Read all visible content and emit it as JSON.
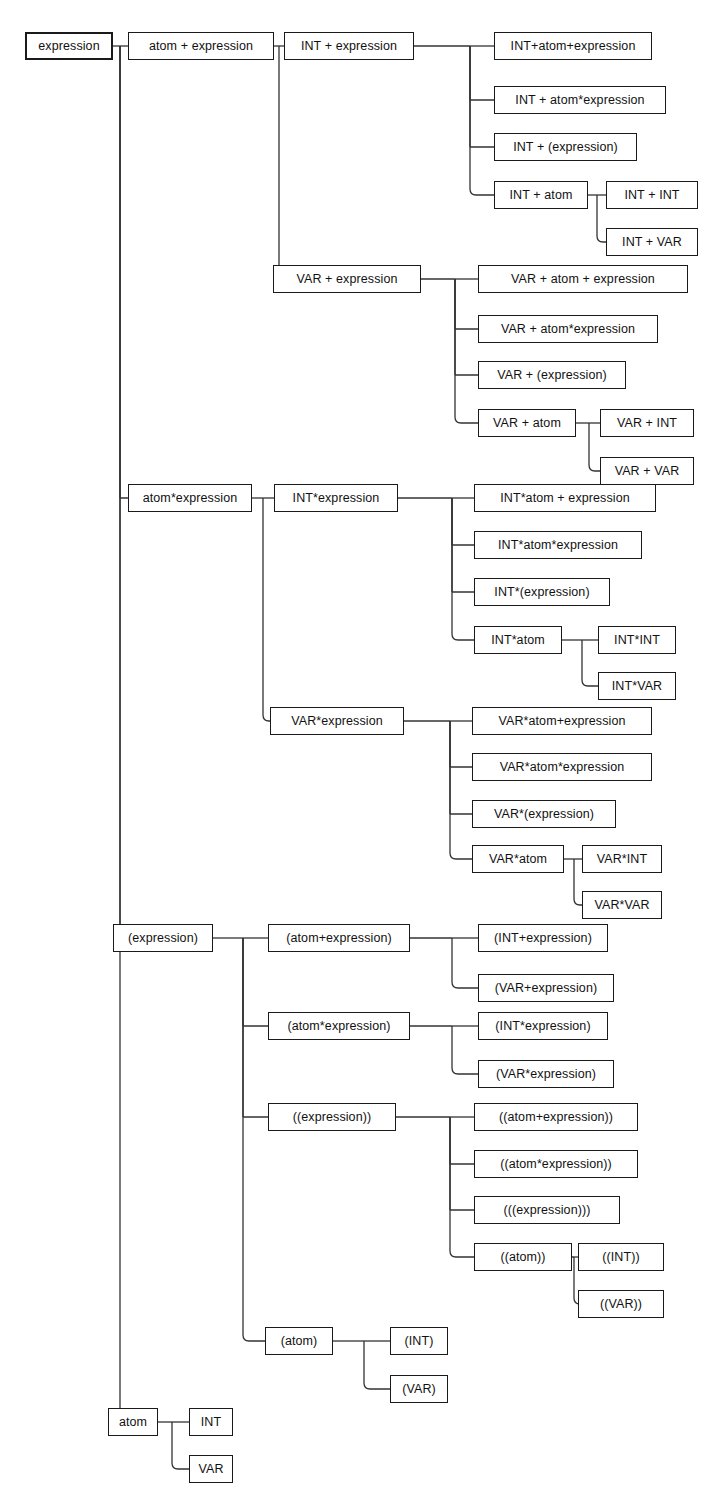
{
  "diagram": {
    "type": "tree-diagram",
    "width": 716,
    "height": 1503,
    "background_color": "#ffffff",
    "box_border_color": "#1a1a1a",
    "edge_color": "#333333",
    "text_color": "#111111"
  },
  "nodes": [
    {
      "id": "n0",
      "label": "expression",
      "x": 25,
      "y": 32,
      "w": 88,
      "h": 28,
      "root": true
    },
    {
      "id": "n1",
      "label": "atom + expression",
      "x": 128,
      "y": 32,
      "w": 146,
      "h": 28
    },
    {
      "id": "n2",
      "label": "INT + expression",
      "x": 284,
      "y": 32,
      "w": 130,
      "h": 28
    },
    {
      "id": "n3",
      "label": "INT+atom+expression",
      "x": 494,
      "y": 32,
      "w": 158,
      "h": 28
    },
    {
      "id": "n4",
      "label": "INT + atom*expression",
      "x": 494,
      "y": 86,
      "w": 172,
      "h": 28
    },
    {
      "id": "n5",
      "label": "INT + (expression)",
      "x": 494,
      "y": 133,
      "w": 143,
      "h": 28
    },
    {
      "id": "n6",
      "label": "INT + atom",
      "x": 494,
      "y": 181,
      "w": 94,
      "h": 28
    },
    {
      "id": "n7",
      "label": "INT + INT",
      "x": 606,
      "y": 181,
      "w": 92,
      "h": 28
    },
    {
      "id": "n8",
      "label": "INT + VAR",
      "x": 606,
      "y": 228,
      "w": 92,
      "h": 28
    },
    {
      "id": "n9",
      "label": "VAR + expression",
      "x": 273,
      "y": 265,
      "w": 148,
      "h": 28
    },
    {
      "id": "n10",
      "label": "VAR + atom +  expression",
      "x": 478,
      "y": 265,
      "w": 210,
      "h": 28
    },
    {
      "id": "n11",
      "label": "VAR + atom*expression",
      "x": 478,
      "y": 315,
      "w": 180,
      "h": 28
    },
    {
      "id": "n12",
      "label": "VAR + (expression)",
      "x": 478,
      "y": 361,
      "w": 148,
      "h": 28
    },
    {
      "id": "n13",
      "label": "VAR + atom",
      "x": 478,
      "y": 409,
      "w": 98,
      "h": 28
    },
    {
      "id": "n14",
      "label": "VAR + INT",
      "x": 600,
      "y": 409,
      "w": 94,
      "h": 28
    },
    {
      "id": "n15",
      "label": "VAR + VAR",
      "x": 600,
      "y": 457,
      "w": 94,
      "h": 28
    },
    {
      "id": "n16",
      "label": "atom*expression",
      "x": 128,
      "y": 484,
      "w": 124,
      "h": 28
    },
    {
      "id": "n17",
      "label": "INT*expression",
      "x": 274,
      "y": 484,
      "w": 124,
      "h": 28
    },
    {
      "id": "n18",
      "label": "INT*atom + expression",
      "x": 474,
      "y": 484,
      "w": 182,
      "h": 28
    },
    {
      "id": "n19",
      "label": "INT*atom*expression",
      "x": 474,
      "y": 531,
      "w": 168,
      "h": 28
    },
    {
      "id": "n20",
      "label": "INT*(expression)",
      "x": 474,
      "y": 578,
      "w": 136,
      "h": 28
    },
    {
      "id": "n21",
      "label": "INT*atom",
      "x": 474,
      "y": 626,
      "w": 88,
      "h": 28
    },
    {
      "id": "n22",
      "label": "INT*INT",
      "x": 598,
      "y": 626,
      "w": 78,
      "h": 28
    },
    {
      "id": "n23",
      "label": "INT*VAR",
      "x": 598,
      "y": 672,
      "w": 78,
      "h": 28
    },
    {
      "id": "n24",
      "label": "VAR*expression",
      "x": 270,
      "y": 707,
      "w": 134,
      "h": 28
    },
    {
      "id": "n25",
      "label": "VAR*atom+expression",
      "x": 472,
      "y": 707,
      "w": 180,
      "h": 28
    },
    {
      "id": "n26",
      "label": "VAR*atom*expression",
      "x": 472,
      "y": 753,
      "w": 180,
      "h": 28
    },
    {
      "id": "n27",
      "label": "VAR*(expression)",
      "x": 472,
      "y": 800,
      "w": 144,
      "h": 28
    },
    {
      "id": "n28",
      "label": "VAR*atom",
      "x": 472,
      "y": 845,
      "w": 92,
      "h": 28
    },
    {
      "id": "n29",
      "label": "VAR*INT",
      "x": 582,
      "y": 845,
      "w": 80,
      "h": 28
    },
    {
      "id": "n30",
      "label": "VAR*VAR",
      "x": 582,
      "y": 891,
      "w": 80,
      "h": 28
    },
    {
      "id": "n31",
      "label": "(expression)",
      "x": 113,
      "y": 924,
      "w": 100,
      "h": 28
    },
    {
      "id": "n32",
      "label": "(atom+expression)",
      "x": 268,
      "y": 924,
      "w": 142,
      "h": 28
    },
    {
      "id": "n33",
      "label": "(INT+expression)",
      "x": 478,
      "y": 924,
      "w": 130,
      "h": 28
    },
    {
      "id": "n34",
      "label": "(VAR+expression)",
      "x": 478,
      "y": 974,
      "w": 136,
      "h": 28
    },
    {
      "id": "n35",
      "label": "(atom*expression)",
      "x": 268,
      "y": 1012,
      "w": 142,
      "h": 28
    },
    {
      "id": "n36",
      "label": "(INT*expression)",
      "x": 478,
      "y": 1012,
      "w": 130,
      "h": 28
    },
    {
      "id": "n37",
      "label": "(VAR*expression)",
      "x": 478,
      "y": 1060,
      "w": 136,
      "h": 28
    },
    {
      "id": "n38",
      "label": "((expression))",
      "x": 268,
      "y": 1103,
      "w": 128,
      "h": 28
    },
    {
      "id": "n39",
      "label": "((atom+expression))",
      "x": 474,
      "y": 1103,
      "w": 164,
      "h": 28
    },
    {
      "id": "n40",
      "label": "((atom*expression))",
      "x": 474,
      "y": 1150,
      "w": 164,
      "h": 28
    },
    {
      "id": "n41",
      "label": "(((expression)))",
      "x": 474,
      "y": 1196,
      "w": 146,
      "h": 28
    },
    {
      "id": "n42",
      "label": "((atom))",
      "x": 474,
      "y": 1243,
      "w": 98,
      "h": 28
    },
    {
      "id": "n43",
      "label": "((INT))",
      "x": 578,
      "y": 1243,
      "w": 86,
      "h": 28
    },
    {
      "id": "n44",
      "label": "((VAR))",
      "x": 578,
      "y": 1290,
      "w": 86,
      "h": 28
    },
    {
      "id": "n45",
      "label": "(atom)",
      "x": 265,
      "y": 1327,
      "w": 68,
      "h": 28
    },
    {
      "id": "n46",
      "label": "(INT)",
      "x": 390,
      "y": 1327,
      "w": 58,
      "h": 28
    },
    {
      "id": "n47",
      "label": "(VAR)",
      "x": 390,
      "y": 1375,
      "w": 58,
      "h": 28
    },
    {
      "id": "n48",
      "label": "atom",
      "x": 108,
      "y": 1408,
      "w": 50,
      "h": 28
    },
    {
      "id": "n49",
      "label": "INT",
      "x": 189,
      "y": 1408,
      "w": 44,
      "h": 28
    },
    {
      "id": "n50",
      "label": "VAR",
      "x": 189,
      "y": 1455,
      "w": 44,
      "h": 28
    }
  ],
  "edges": [
    {
      "from": "n0",
      "children": [
        "n1",
        "n16",
        "n31",
        "n48"
      ],
      "trunk": 120
    },
    {
      "from": "n1",
      "children": [
        "n2",
        "n9"
      ],
      "trunk": 279
    },
    {
      "from": "n2",
      "children": [
        "n3",
        "n4",
        "n5",
        "n6"
      ],
      "trunk": 470
    },
    {
      "from": "n6",
      "children": [
        "n7",
        "n8"
      ],
      "trunk": 597
    },
    {
      "from": "n9",
      "children": [
        "n10",
        "n11",
        "n12",
        "n13"
      ],
      "trunk": 455
    },
    {
      "from": "n13",
      "children": [
        "n14",
        "n15"
      ],
      "trunk": 589
    },
    {
      "from": "n16",
      "children": [
        "n17",
        "n24"
      ],
      "trunk": 263
    },
    {
      "from": "n17",
      "children": [
        "n18",
        "n19",
        "n20",
        "n21"
      ],
      "trunk": 452
    },
    {
      "from": "n21",
      "children": [
        "n22",
        "n23"
      ],
      "trunk": 582
    },
    {
      "from": "n24",
      "children": [
        "n25",
        "n26",
        "n27",
        "n28"
      ],
      "trunk": 450
    },
    {
      "from": "n28",
      "children": [
        "n29",
        "n30"
      ],
      "trunk": 574
    },
    {
      "from": "n31",
      "children": [
        "n32",
        "n35",
        "n38",
        "n45"
      ],
      "trunk": 243
    },
    {
      "from": "n32",
      "children": [
        "n33",
        "n34"
      ],
      "trunk": 452
    },
    {
      "from": "n35",
      "children": [
        "n36",
        "n37"
      ],
      "trunk": 452
    },
    {
      "from": "n38",
      "children": [
        "n39",
        "n40",
        "n41",
        "n42"
      ],
      "trunk": 450
    },
    {
      "from": "n42",
      "children": [
        "n43",
        "n44"
      ],
      "trunk": 574
    },
    {
      "from": "n45",
      "children": [
        "n46",
        "n47"
      ],
      "trunk": 364
    },
    {
      "from": "n48",
      "children": [
        "n49",
        "n50"
      ],
      "trunk": 172
    }
  ]
}
